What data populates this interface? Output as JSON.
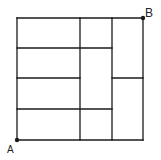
{
  "diagram": {
    "type": "grid-path",
    "labels": {
      "start": "A",
      "end": "B"
    },
    "colors": {
      "line": "#1a1a1a",
      "background": "#ffffff"
    },
    "outer_box": {
      "x1": 17,
      "y1": 18,
      "x2": 143,
      "y2": 140
    },
    "segments": [
      {
        "x1": 17,
        "y1": 18,
        "x2": 143,
        "y2": 18
      },
      {
        "x1": 17,
        "y1": 140,
        "x2": 143,
        "y2": 140
      },
      {
        "x1": 17,
        "y1": 18,
        "x2": 17,
        "y2": 140
      },
      {
        "x1": 143,
        "y1": 18,
        "x2": 143,
        "y2": 140
      },
      {
        "x1": 80,
        "y1": 18,
        "x2": 80,
        "y2": 140
      },
      {
        "x1": 112,
        "y1": 18,
        "x2": 112,
        "y2": 140
      },
      {
        "x1": 17,
        "y1": 48,
        "x2": 112,
        "y2": 48
      },
      {
        "x1": 17,
        "y1": 78,
        "x2": 80,
        "y2": 78
      },
      {
        "x1": 17,
        "y1": 109,
        "x2": 112,
        "y2": 109
      },
      {
        "x1": 112,
        "y1": 78,
        "x2": 143,
        "y2": 78
      }
    ],
    "points": [
      {
        "name": "A",
        "x": 17,
        "y": 140
      },
      {
        "name": "B",
        "x": 143,
        "y": 18
      }
    ]
  }
}
